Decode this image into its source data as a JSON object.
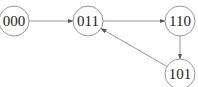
{
  "diagram": {
    "type": "state-transition-graph",
    "colors": {
      "background": "#ffffff",
      "node_stroke": "#8a8a8a",
      "edge_stroke": "#8a8a8a",
      "text": "#222222"
    },
    "nodes": [
      {
        "id": "000",
        "label": "000",
        "cx": 14,
        "cy": 21,
        "r": 15
      },
      {
        "id": "011",
        "label": "011",
        "cx": 88,
        "cy": 21,
        "r": 15
      },
      {
        "id": "110",
        "label": "110",
        "cx": 180,
        "cy": 21,
        "r": 15
      },
      {
        "id": "101",
        "label": "101",
        "cx": 180,
        "cy": 74,
        "r": 15
      }
    ],
    "edges": [
      {
        "from": "000",
        "to": "011"
      },
      {
        "from": "011",
        "to": "110"
      },
      {
        "from": "110",
        "to": "101"
      },
      {
        "from": "101",
        "to": "011"
      }
    ]
  }
}
